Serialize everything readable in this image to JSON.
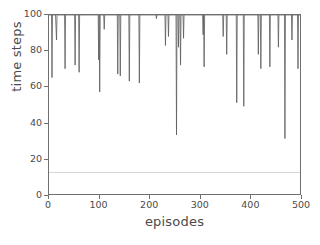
{
  "chart_data": {
    "type": "line",
    "title": "",
    "xlabel": "episodes",
    "ylabel": "time steps",
    "xlim": [
      0,
      500
    ],
    "ylim": [
      0,
      100
    ],
    "xticks": [
      0,
      100,
      200,
      300,
      400,
      500
    ],
    "yticks": [
      0,
      20,
      40,
      60,
      80,
      100
    ],
    "xtick_labels": [
      "0",
      "100",
      "200",
      "300",
      "400",
      "500"
    ],
    "ytick_labels": [
      "0",
      "20",
      "40",
      "60",
      "80",
      "100"
    ],
    "grid": false,
    "legend": null,
    "series_color": "#5a5a5a",
    "reference_line_color": "#b4b4b4",
    "axis_color": "#6f6f6f",
    "background": "#ffffff",
    "baseline_value": 100,
    "annotations": [
      {
        "name": "reference-line",
        "type": "hline",
        "y": 12,
        "color": "#b4b4b4"
      }
    ],
    "series": [
      {
        "name": "time steps per episode",
        "color": "#5a5a5a",
        "note": "Nearly all episodes hit the 100 step cap; listed points are the downward spikes (episode, time steps).",
        "points": [
          [
            6,
            65
          ],
          [
            8,
            100
          ],
          [
            10,
            100
          ],
          [
            14,
            93
          ],
          [
            15,
            86
          ],
          [
            17,
            100
          ],
          [
            30,
            100
          ],
          [
            32,
            70
          ],
          [
            34,
            100
          ],
          [
            50,
            100
          ],
          [
            52,
            72
          ],
          [
            54,
            100
          ],
          [
            58,
            100
          ],
          [
            60,
            68
          ],
          [
            62,
            100
          ],
          [
            97,
            100
          ],
          [
            99,
            75
          ],
          [
            101,
            57
          ],
          [
            103,
            100
          ],
          [
            108,
            100
          ],
          [
            110,
            92
          ],
          [
            112,
            100
          ],
          [
            135,
            100
          ],
          [
            137,
            67
          ],
          [
            139,
            100
          ],
          [
            140,
            100
          ],
          [
            142,
            66
          ],
          [
            144,
            100
          ],
          [
            158,
            100
          ],
          [
            160,
            63
          ],
          [
            162,
            100
          ],
          [
            178,
            100
          ],
          [
            180,
            62
          ],
          [
            182,
            100
          ],
          [
            212,
            100
          ],
          [
            214,
            98
          ],
          [
            216,
            100
          ],
          [
            230,
            100
          ],
          [
            232,
            83
          ],
          [
            234,
            100
          ],
          [
            236,
            100
          ],
          [
            238,
            88
          ],
          [
            240,
            100
          ],
          [
            252,
            100
          ],
          [
            254,
            33
          ],
          [
            256,
            100
          ],
          [
            257,
            100
          ],
          [
            258,
            82
          ],
          [
            259,
            100
          ],
          [
            260,
            100
          ],
          [
            262,
            72
          ],
          [
            264,
            100
          ],
          [
            266,
            100
          ],
          [
            268,
            87
          ],
          [
            270,
            100
          ],
          [
            305,
            100
          ],
          [
            307,
            89
          ],
          [
            309,
            71
          ],
          [
            311,
            100
          ],
          [
            345,
            100
          ],
          [
            347,
            88
          ],
          [
            349,
            100
          ],
          [
            352,
            100
          ],
          [
            354,
            78
          ],
          [
            356,
            100
          ],
          [
            372,
            100
          ],
          [
            374,
            51
          ],
          [
            376,
            100
          ],
          [
            386,
            100
          ],
          [
            388,
            49
          ],
          [
            390,
            100
          ],
          [
            415,
            100
          ],
          [
            417,
            78
          ],
          [
            419,
            100
          ],
          [
            420,
            100
          ],
          [
            422,
            70
          ],
          [
            424,
            100
          ],
          [
            438,
            100
          ],
          [
            440,
            71
          ],
          [
            442,
            100
          ],
          [
            455,
            100
          ],
          [
            457,
            82
          ],
          [
            459,
            100
          ],
          [
            468,
            100
          ],
          [
            470,
            31
          ],
          [
            472,
            100
          ],
          [
            482,
            100
          ],
          [
            484,
            86
          ],
          [
            486,
            100
          ],
          [
            494,
            100
          ],
          [
            496,
            70
          ],
          [
            498,
            100
          ]
        ]
      }
    ]
  }
}
